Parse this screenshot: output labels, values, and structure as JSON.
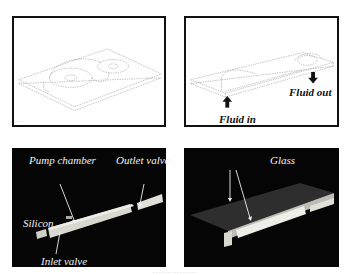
{
  "figure": {
    "panels": [
      {
        "id": "top-left",
        "style": "line-drawing",
        "description": "Isometric CAD view of micropump plate with two circular chambers",
        "labels": [],
        "corner_stamp": "........"
      },
      {
        "id": "top-right",
        "style": "line-drawing",
        "description": "Isometric CAD view of micropump with flow arrows",
        "labels": [
          {
            "text": "Fluid in"
          },
          {
            "text": "Fluid out"
          }
        ],
        "corner_stamp": "........"
      },
      {
        "id": "bottom-left",
        "style": "dark-render",
        "description": "Cross-section rendering of silicon layer",
        "labels": [
          {
            "text": "Pump chamber"
          },
          {
            "text": "Outlet valve"
          },
          {
            "text": "Silicon"
          },
          {
            "text": "Inlet valve"
          }
        ]
      },
      {
        "id": "bottom-right",
        "style": "dark-render",
        "description": "Cross-section rendering with glass cover",
        "labels": [
          {
            "text": "Glass"
          }
        ]
      }
    ],
    "caption": ". . . . . . . . . . . . . . ."
  }
}
